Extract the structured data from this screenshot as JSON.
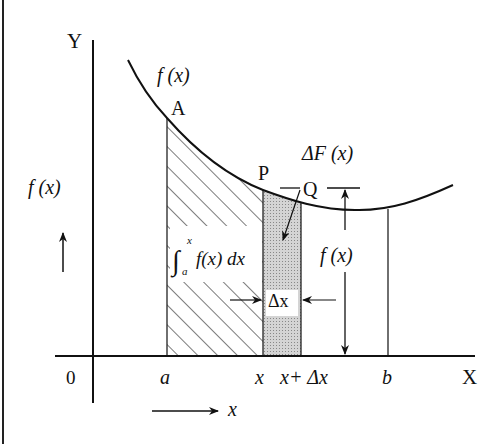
{
  "figure": {
    "type": "definite integral as area under curve",
    "axes": {
      "y_label": "Y",
      "x_label": "X",
      "origin_label": "0"
    },
    "curve": {
      "label": "f (x)",
      "points": {
        "A": "A",
        "P": "P",
        "Q": "Q"
      }
    },
    "x_ticks": {
      "a": "a",
      "x": "x",
      "x_plus_dx": "x+ Δx",
      "b": "b"
    },
    "regions": {
      "hatched_label_integral": "∫",
      "hatched_label_upper": "x",
      "hatched_label_lower": "a",
      "hatched_label_body": "f(x) dx",
      "strip_label": "ΔF (x)",
      "strip_width_label": "Δx"
    },
    "height_label": "f (x)",
    "side_annotations": {
      "y_direction_label": "f (x)",
      "x_direction_label": "x"
    },
    "colors": {
      "ink": "#111111",
      "strip_fill": "#c8c8c8",
      "background": "#ffffff"
    }
  }
}
